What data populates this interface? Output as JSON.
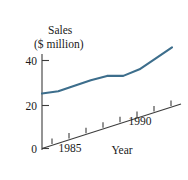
{
  "chart_data": {
    "type": "line",
    "title": "",
    "ylabel": "Sales",
    "ylabel_units": "($ million)",
    "xlabel": "Year",
    "ylim": [
      0,
      48
    ],
    "yticks": [
      0,
      20,
      40
    ],
    "ytick_labels": [
      "0",
      "20",
      "40"
    ],
    "xlim": [
      1983.5,
      1992.5
    ],
    "xticks": [
      1984,
      1985,
      1986,
      1987,
      1988,
      1989,
      1990,
      1991
    ],
    "xtick_labels": [
      "",
      "1985",
      "",
      "",
      "",
      "",
      "1990",
      ""
    ],
    "x": [
      1984,
      1985,
      1986,
      1987,
      1988,
      1989,
      1990,
      1991,
      1992
    ],
    "values": [
      25,
      26,
      28.5,
      31,
      33,
      33,
      36,
      41,
      46
    ],
    "series": [
      {
        "name": "Sales",
        "values": [
          25,
          26,
          28.5,
          31,
          33,
          33,
          36,
          41,
          46
        ]
      }
    ],
    "grid": false,
    "legend": false,
    "legend_position": "none",
    "annotations": [],
    "axis_style": "slanted-x-axis",
    "line_color": "#3d6e8c",
    "axis_color": "#3c3c3c"
  },
  "labels": {
    "y_axis_name": "Sales",
    "y_axis_units": "($ million)",
    "x_axis_name": "Year",
    "y_tick_0": "0",
    "y_tick_20": "20",
    "y_tick_40": "40",
    "x_tick_1985": "1985",
    "x_tick_1990": "1990"
  }
}
